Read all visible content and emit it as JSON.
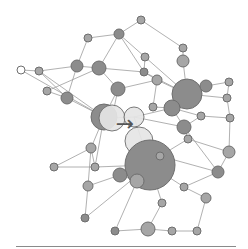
{
  "diagram": {
    "type": "network-graph",
    "background": "#ffffff",
    "edge_color": "#9a9a9a",
    "node_fill_dark": "#8c8c8c",
    "node_fill_mid": "#a6a6a6",
    "node_fill_light": "#e6e6e6",
    "center_icon": "arrow-right-icon",
    "center_glyph": "→",
    "nodes": [
      {
        "id": "n1",
        "x": 21,
        "y": 70,
        "r": 4,
        "fill": "#ffffff"
      },
      {
        "id": "n2",
        "x": 39,
        "y": 71,
        "r": 4,
        "fill": "#a6a6a6"
      },
      {
        "id": "n3",
        "x": 77,
        "y": 66,
        "r": 6,
        "fill": "#8c8c8c"
      },
      {
        "id": "n4",
        "x": 99,
        "y": 68,
        "r": 7,
        "fill": "#8c8c8c"
      },
      {
        "id": "n5",
        "x": 88,
        "y": 38,
        "r": 4,
        "fill": "#a6a6a6"
      },
      {
        "id": "n6",
        "x": 119,
        "y": 34,
        "r": 5,
        "fill": "#8c8c8c"
      },
      {
        "id": "n7",
        "x": 141,
        "y": 20,
        "r": 4,
        "fill": "#a6a6a6"
      },
      {
        "id": "n8",
        "x": 47,
        "y": 91,
        "r": 4,
        "fill": "#a6a6a6"
      },
      {
        "id": "n9",
        "x": 67,
        "y": 98,
        "r": 6,
        "fill": "#8c8c8c"
      },
      {
        "id": "n10",
        "x": 118,
        "y": 89,
        "r": 7,
        "fill": "#8c8c8c"
      },
      {
        "id": "n11",
        "x": 145,
        "y": 57,
        "r": 4,
        "fill": "#a6a6a6"
      },
      {
        "id": "n12",
        "x": 144,
        "y": 72,
        "r": 4,
        "fill": "#8c8c8c"
      },
      {
        "id": "n13",
        "x": 183,
        "y": 48,
        "r": 4,
        "fill": "#a6a6a6"
      },
      {
        "id": "n14",
        "x": 183,
        "y": 61,
        "r": 6,
        "fill": "#a6a6a6"
      },
      {
        "id": "n15",
        "x": 157,
        "y": 80,
        "r": 5,
        "fill": "#a6a6a6"
      },
      {
        "id": "n16",
        "x": 187,
        "y": 94,
        "r": 15,
        "fill": "#8c8c8c"
      },
      {
        "id": "n17",
        "x": 206,
        "y": 86,
        "r": 6,
        "fill": "#8c8c8c"
      },
      {
        "id": "n18",
        "x": 229,
        "y": 82,
        "r": 4,
        "fill": "#a6a6a6"
      },
      {
        "id": "n19",
        "x": 227,
        "y": 98,
        "r": 4,
        "fill": "#a6a6a6"
      },
      {
        "id": "n20",
        "x": 172,
        "y": 108,
        "r": 8,
        "fill": "#8c8c8c"
      },
      {
        "id": "n21",
        "x": 153,
        "y": 107,
        "r": 4,
        "fill": "#a6a6a6"
      },
      {
        "id": "n22",
        "x": 201,
        "y": 116,
        "r": 4,
        "fill": "#a6a6a6"
      },
      {
        "id": "n23",
        "x": 230,
        "y": 118,
        "r": 4,
        "fill": "#a6a6a6"
      },
      {
        "id": "n24",
        "x": 104,
        "y": 117,
        "r": 13,
        "fill": "#8c8c8c"
      },
      {
        "id": "n25",
        "x": 112,
        "y": 118,
        "r": 13,
        "fill": "#e6e6e6"
      },
      {
        "id": "n26",
        "x": 134,
        "y": 117,
        "r": 10,
        "fill": "#e6e6e6"
      },
      {
        "id": "n27",
        "x": 139,
        "y": 141,
        "r": 14,
        "fill": "#e6e6e6"
      },
      {
        "id": "n28",
        "x": 184,
        "y": 127,
        "r": 7,
        "fill": "#8c8c8c"
      },
      {
        "id": "n29",
        "x": 91,
        "y": 148,
        "r": 5,
        "fill": "#a6a6a6"
      },
      {
        "id": "n30",
        "x": 54,
        "y": 167,
        "r": 4,
        "fill": "#a6a6a6"
      },
      {
        "id": "n31",
        "x": 95,
        "y": 167,
        "r": 4,
        "fill": "#a6a6a6"
      },
      {
        "id": "n32",
        "x": 150,
        "y": 165,
        "r": 25,
        "fill": "#8c8c8c"
      },
      {
        "id": "n33",
        "x": 88,
        "y": 186,
        "r": 5,
        "fill": "#a6a6a6"
      },
      {
        "id": "n34",
        "x": 120,
        "y": 175,
        "r": 7,
        "fill": "#8c8c8c"
      },
      {
        "id": "n35",
        "x": 137,
        "y": 181,
        "r": 7,
        "fill": "#a6a6a6"
      },
      {
        "id": "n36",
        "x": 160,
        "y": 156,
        "r": 4,
        "fill": "#a6a6a6"
      },
      {
        "id": "n37",
        "x": 188,
        "y": 139,
        "r": 4,
        "fill": "#a6a6a6"
      },
      {
        "id": "n38",
        "x": 229,
        "y": 152,
        "r": 6,
        "fill": "#a6a6a6"
      },
      {
        "id": "n39",
        "x": 218,
        "y": 172,
        "r": 6,
        "fill": "#8c8c8c"
      },
      {
        "id": "n40",
        "x": 184,
        "y": 187,
        "r": 4,
        "fill": "#a6a6a6"
      },
      {
        "id": "n41",
        "x": 206,
        "y": 198,
        "r": 5,
        "fill": "#a6a6a6"
      },
      {
        "id": "n42",
        "x": 162,
        "y": 203,
        "r": 4,
        "fill": "#a6a6a6"
      },
      {
        "id": "n43",
        "x": 85,
        "y": 218,
        "r": 4,
        "fill": "#8c8c8c"
      },
      {
        "id": "n44",
        "x": 115,
        "y": 231,
        "r": 4,
        "fill": "#8c8c8c"
      },
      {
        "id": "n45",
        "x": 148,
        "y": 229,
        "r": 7,
        "fill": "#a6a6a6"
      },
      {
        "id": "n46",
        "x": 172,
        "y": 231,
        "r": 4,
        "fill": "#a6a6a6"
      },
      {
        "id": "n47",
        "x": 197,
        "y": 231,
        "r": 4,
        "fill": "#a6a6a6"
      }
    ],
    "edges": [
      [
        "n1",
        "n2"
      ],
      [
        "n2",
        "n3"
      ],
      [
        "n3",
        "n4"
      ],
      [
        "n3",
        "n5"
      ],
      [
        "n4",
        "n6"
      ],
      [
        "n5",
        "n6"
      ],
      [
        "n6",
        "n7"
      ],
      [
        "n2",
        "n9"
      ],
      [
        "n2",
        "n24"
      ],
      [
        "n1",
        "n24"
      ],
      [
        "n8",
        "n9"
      ],
      [
        "n8",
        "n4"
      ],
      [
        "n3",
        "n9"
      ],
      [
        "n4",
        "n10"
      ],
      [
        "n4",
        "n12"
      ],
      [
        "n6",
        "n12"
      ],
      [
        "n7",
        "n13"
      ],
      [
        "n11",
        "n12"
      ],
      [
        "n11",
        "n6"
      ],
      [
        "n12",
        "n15"
      ],
      [
        "n13",
        "n14"
      ],
      [
        "n14",
        "n16"
      ],
      [
        "n15",
        "n16"
      ],
      [
        "n12",
        "n16"
      ],
      [
        "n10",
        "n15"
      ],
      [
        "n16",
        "n17"
      ],
      [
        "n17",
        "n18"
      ],
      [
        "n18",
        "n19"
      ],
      [
        "n16",
        "n19"
      ],
      [
        "n16",
        "n20"
      ],
      [
        "n20",
        "n21"
      ],
      [
        "n20",
        "n22"
      ],
      [
        "n22",
        "n23"
      ],
      [
        "n19",
        "n23"
      ],
      [
        "n10",
        "n25"
      ],
      [
        "n25",
        "n26"
      ],
      [
        "n24",
        "n29"
      ],
      [
        "n29",
        "n30"
      ],
      [
        "n9",
        "n24"
      ],
      [
        "n26",
        "n20"
      ],
      [
        "n26",
        "n28"
      ],
      [
        "n28",
        "n22"
      ],
      [
        "n28",
        "n37"
      ],
      [
        "n27",
        "n32"
      ],
      [
        "n32",
        "n36"
      ],
      [
        "n36",
        "n37"
      ],
      [
        "n37",
        "n38"
      ],
      [
        "n23",
        "n38"
      ],
      [
        "n38",
        "n39"
      ],
      [
        "n39",
        "n40"
      ],
      [
        "n40",
        "n41"
      ],
      [
        "n32",
        "n40"
      ],
      [
        "n32",
        "n42"
      ],
      [
        "n42",
        "n45"
      ],
      [
        "n45",
        "n46"
      ],
      [
        "n46",
        "n47"
      ],
      [
        "n41",
        "n47"
      ],
      [
        "n34",
        "n35"
      ],
      [
        "n32",
        "n35"
      ],
      [
        "n33",
        "n34"
      ],
      [
        "n29",
        "n31"
      ],
      [
        "n31",
        "n32"
      ],
      [
        "n33",
        "n43"
      ],
      [
        "n43",
        "n32"
      ],
      [
        "n44",
        "n45"
      ],
      [
        "n35",
        "n44"
      ],
      [
        "n30",
        "n31"
      ],
      [
        "n20",
        "n28"
      ],
      [
        "n15",
        "n21"
      ],
      [
        "n11",
        "n16"
      ],
      [
        "n10",
        "n24"
      ],
      [
        "n26",
        "n32"
      ],
      [
        "n24",
        "n31"
      ],
      [
        "n29",
        "n33"
      ],
      [
        "n36",
        "n39"
      ],
      [
        "n28",
        "n39"
      ]
    ]
  }
}
